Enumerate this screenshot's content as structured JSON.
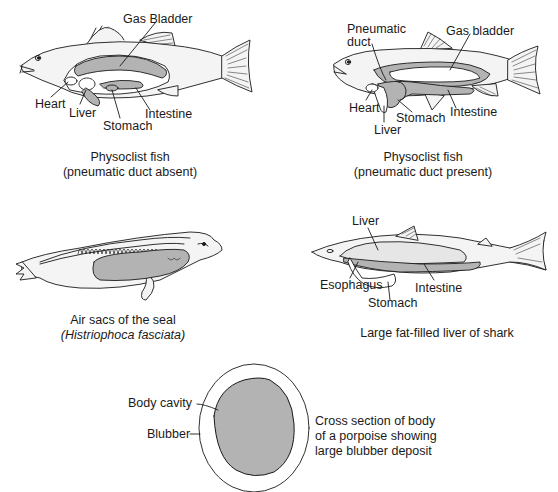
{
  "colors": {
    "background": "#ffffff",
    "ink": "#1a1a1a",
    "organ_fill": "#b3b3b3",
    "body_fill": "#f4f4f4"
  },
  "panels": {
    "fish_absent": {
      "labels": {
        "gas_bladder": "Gas Bladder",
        "heart": "Heart",
        "liver": "Liver",
        "stomach": "Stomach",
        "intestine": "Intestine"
      },
      "caption_line1": "Physoclist fish",
      "caption_line2": "(pneumatic duct absent)"
    },
    "fish_present": {
      "labels": {
        "pneumatic_duct_1": "Pneumatic",
        "pneumatic_duct_2": "duct",
        "gas_bladder": "Gas bladder",
        "heart": "Heart",
        "liver": "Liver",
        "stomach": "Stomach",
        "intestine": "Intestine"
      },
      "caption_line1": "Physoclist fish",
      "caption_line2": "(pneumatic duct present)"
    },
    "seal": {
      "caption_line1": "Air sacs of the seal",
      "caption_line2": "(Histriophoca fasciata)"
    },
    "shark": {
      "labels": {
        "liver": "Liver",
        "esophagus": "Esophagus",
        "stomach": "Stomach",
        "intestine": "Intestine"
      },
      "caption": "Large fat-filled liver of shark"
    },
    "porpoise": {
      "labels": {
        "body_cavity": "Body cavity",
        "blubber": "Blubber"
      },
      "description_line1": "Cross section of body",
      "description_line2": "of a porpoise showing",
      "description_line3": "large blubber deposit"
    }
  }
}
